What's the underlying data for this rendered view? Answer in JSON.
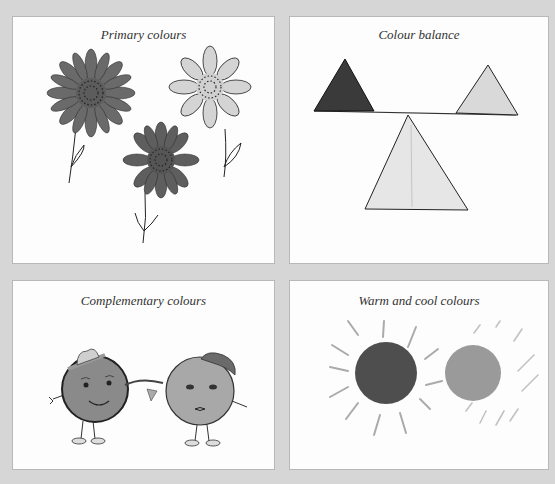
{
  "panels": [
    {
      "id": "primary",
      "caption": "Primary colours"
    },
    {
      "id": "balance",
      "caption": "Colour balance"
    },
    {
      "id": "complementary",
      "caption": "Complementary colours"
    },
    {
      "id": "warm-cool",
      "caption": "Warm and cool colours"
    }
  ],
  "colors": {
    "background": "#d6d6d6",
    "panel": "#fdfdfd",
    "dark_flower": "#6a6a6a",
    "light_flower": "#d4d4d4",
    "mid_flower": "#5e5e5e",
    "dark_triangle": "#3a3a3a",
    "light_triangle": "#d9d9d9",
    "pale_triangle": "#e6e6e6",
    "warm_sun": "#4e4e4e",
    "cool_sun": "#9a9a9a"
  }
}
